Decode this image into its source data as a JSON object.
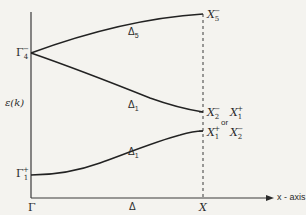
{
  "figure": {
    "type": "energy band diagram",
    "y_axis_label": "ε(k)",
    "x_axis_label": "x - axis",
    "x_points": {
      "start": "Γ",
      "middle": "Δ",
      "end": "X"
    },
    "gamma_levels": {
      "upper": {
        "base": "Γ",
        "sub": "4",
        "sup": "−"
      },
      "lower": {
        "base": "Γ",
        "sub": "1",
        "sup": "+"
      }
    },
    "bands": [
      {
        "name": "upper-band",
        "label_base": "Δ",
        "label_sub": "5",
        "start": "Γ4−",
        "end": "X5−"
      },
      {
        "name": "middle-band",
        "label_base": "Δ",
        "label_sub": "1",
        "start": "Γ4−",
        "end": "X2− or X1+"
      },
      {
        "name": "lower-band",
        "label_base": "Δ",
        "label_sub": "1",
        "start": "Γ1+",
        "end": "X1+ X2−"
      }
    ],
    "x_end_labels": {
      "top": {
        "base": "X",
        "sub": "5",
        "sup": "−"
      },
      "middle_a": {
        "base": "X",
        "sub": "2",
        "sup": "−"
      },
      "middle_b": {
        "base": "X",
        "sub": "1",
        "sup": "+"
      },
      "or_word": "or",
      "bottom_a": {
        "base": "X",
        "sub": "1",
        "sup": "+"
      },
      "bottom_b": {
        "base": "X",
        "sub": "2",
        "sup": "−"
      }
    },
    "colors": {
      "line": "#2a2a2a",
      "background": "#f4f3ef"
    }
  }
}
